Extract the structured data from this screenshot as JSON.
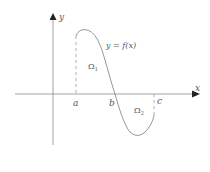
{
  "diagram": {
    "axis_labels": {
      "x": "x",
      "y": "y"
    },
    "points": {
      "a": "a",
      "b": "b",
      "c": "c"
    },
    "curve_label": "y = f(x)",
    "regions": {
      "omega1": "Ω",
      "omega1_sub": "1",
      "omega2": "Ω",
      "omega2_sub": "2"
    },
    "colors": {
      "axis": "#8a8a8a",
      "curve": "#8a8a8a",
      "text": "#555555",
      "dashed": "#9a9a9a"
    }
  }
}
